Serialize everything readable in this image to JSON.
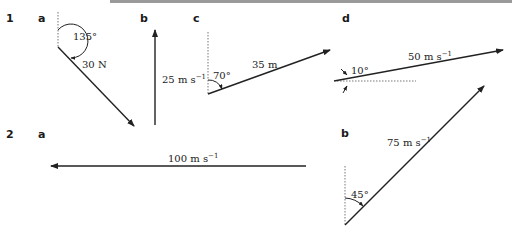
{
  "header_bar": {
    "color": "#9a9a9a"
  },
  "questions": [
    {
      "number": "1",
      "parts": [
        {
          "label": "a",
          "magnitude": "30 N",
          "angle": "135°",
          "reference": "vertical"
        },
        {
          "label": "b",
          "magnitude": "25 m s",
          "unit_exp": "−1",
          "direction": "up"
        },
        {
          "label": "c",
          "magnitude": "35 m",
          "angle": "70°",
          "reference": "vertical"
        },
        {
          "label": "d",
          "magnitude": "50 m s",
          "unit_exp": "−1",
          "angle": "10°",
          "reference": "horizontal"
        }
      ]
    },
    {
      "number": "2",
      "parts": [
        {
          "label": "a",
          "magnitude": "100 m s",
          "unit_exp": "−1",
          "direction": "left"
        },
        {
          "label": "b",
          "magnitude": "75 m s",
          "unit_exp": "−1",
          "angle": "45°",
          "reference": "vertical"
        }
      ]
    }
  ],
  "colors": {
    "line": "#222222",
    "dotted": "#777777"
  }
}
